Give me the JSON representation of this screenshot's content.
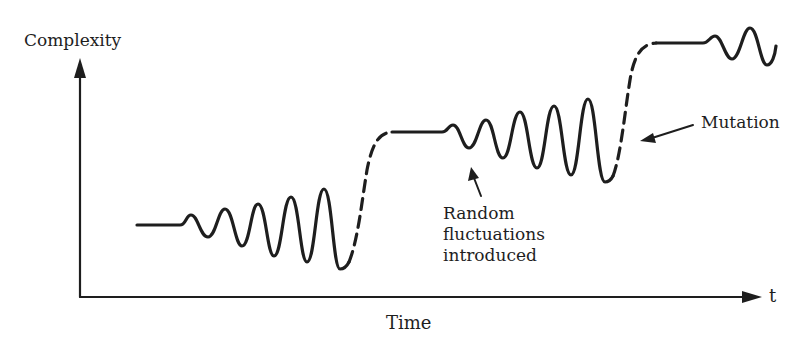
{
  "diagram": {
    "y_axis": {
      "label": "Complexity"
    },
    "x_axis": {
      "label": "Time",
      "end_label": "t"
    },
    "annotations": {
      "fluctuations": {
        "line1": "Random",
        "line2": "fluctuations",
        "line3": "introduced"
      },
      "mutation": "Mutation"
    },
    "segments": [
      {
        "type": "flat",
        "style": "solid",
        "description": "baseline level 1"
      },
      {
        "type": "growing-oscillation",
        "style": "solid",
        "cycles": 5
      },
      {
        "type": "jump",
        "style": "dashed",
        "description": "mutation to level 2"
      },
      {
        "type": "flat",
        "style": "solid",
        "description": "plateau level 2"
      },
      {
        "type": "growing-oscillation",
        "style": "solid",
        "cycles": 5
      },
      {
        "type": "jump",
        "style": "dashed",
        "description": "mutation to level 3"
      },
      {
        "type": "flat",
        "style": "solid",
        "description": "plateau level 3"
      },
      {
        "type": "growing-oscillation",
        "style": "solid",
        "cycles": 2
      }
    ],
    "colors": {
      "ink": "#1e1e1e",
      "background": "#ffffff"
    }
  }
}
